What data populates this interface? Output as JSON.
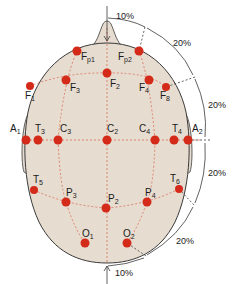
{
  "diagram": {
    "colors": {
      "scalp": "#e6dcd0",
      "outline": "#3a3a3a",
      "electrode": "#d42a1a",
      "grid": "#d9604a",
      "measure": "#3a3a3a"
    },
    "electrodes": [
      {
        "id": "Fp1",
        "base": "F",
        "sub": "p1",
        "x": 77,
        "y": 51
      },
      {
        "id": "Fp2",
        "base": "F",
        "sub": "p2",
        "x": 139,
        "y": 51
      },
      {
        "id": "F1",
        "base": "F",
        "sub": "1",
        "x": 30,
        "y": 86
      },
      {
        "id": "F3",
        "base": "F",
        "sub": "3",
        "x": 66,
        "y": 80
      },
      {
        "id": "F2",
        "base": "F",
        "sub": "2",
        "x": 107,
        "y": 73
      },
      {
        "id": "F4",
        "base": "F",
        "sub": "4",
        "x": 149,
        "y": 80
      },
      {
        "id": "F8",
        "base": "F",
        "sub": "8",
        "x": 166,
        "y": 87
      },
      {
        "id": "A1",
        "base": "A",
        "sub": "1",
        "x": 26,
        "y": 140
      },
      {
        "id": "T3",
        "base": "T",
        "sub": "3",
        "x": 38,
        "y": 140
      },
      {
        "id": "C3",
        "base": "C",
        "sub": "3",
        "x": 58,
        "y": 140
      },
      {
        "id": "C2",
        "base": "C",
        "sub": "2",
        "x": 107,
        "y": 140
      },
      {
        "id": "C4",
        "base": "C",
        "sub": "4",
        "x": 155,
        "y": 140
      },
      {
        "id": "T4",
        "base": "T",
        "sub": "4",
        "x": 174,
        "y": 140
      },
      {
        "id": "A2",
        "base": "A",
        "sub": "2",
        "x": 188,
        "y": 140
      },
      {
        "id": "T5",
        "base": "T",
        "sub": "5",
        "x": 34,
        "y": 190
      },
      {
        "id": "T6",
        "base": "T",
        "sub": "6",
        "x": 179,
        "y": 189
      },
      {
        "id": "P3",
        "base": "P",
        "sub": "3",
        "x": 66,
        "y": 202
      },
      {
        "id": "P2",
        "base": "P",
        "sub": "2",
        "x": 106,
        "y": 208
      },
      {
        "id": "P4",
        "base": "P",
        "sub": "4",
        "x": 147,
        "y": 202
      },
      {
        "id": "O1",
        "base": "O",
        "sub": "1",
        "x": 85,
        "y": 243
      },
      {
        "id": "O2",
        "base": "O",
        "sub": "2",
        "x": 127,
        "y": 243
      }
    ],
    "measurements": [
      {
        "label": "10%",
        "x": 116,
        "y": 19
      },
      {
        "label": "20%",
        "x": 173,
        "y": 46
      },
      {
        "label": "20%",
        "x": 208,
        "y": 108
      },
      {
        "label": "20%",
        "x": 208,
        "y": 176
      },
      {
        "label": "20%",
        "x": 176,
        "y": 244
      },
      {
        "label": "10%",
        "x": 115,
        "y": 276
      }
    ]
  }
}
